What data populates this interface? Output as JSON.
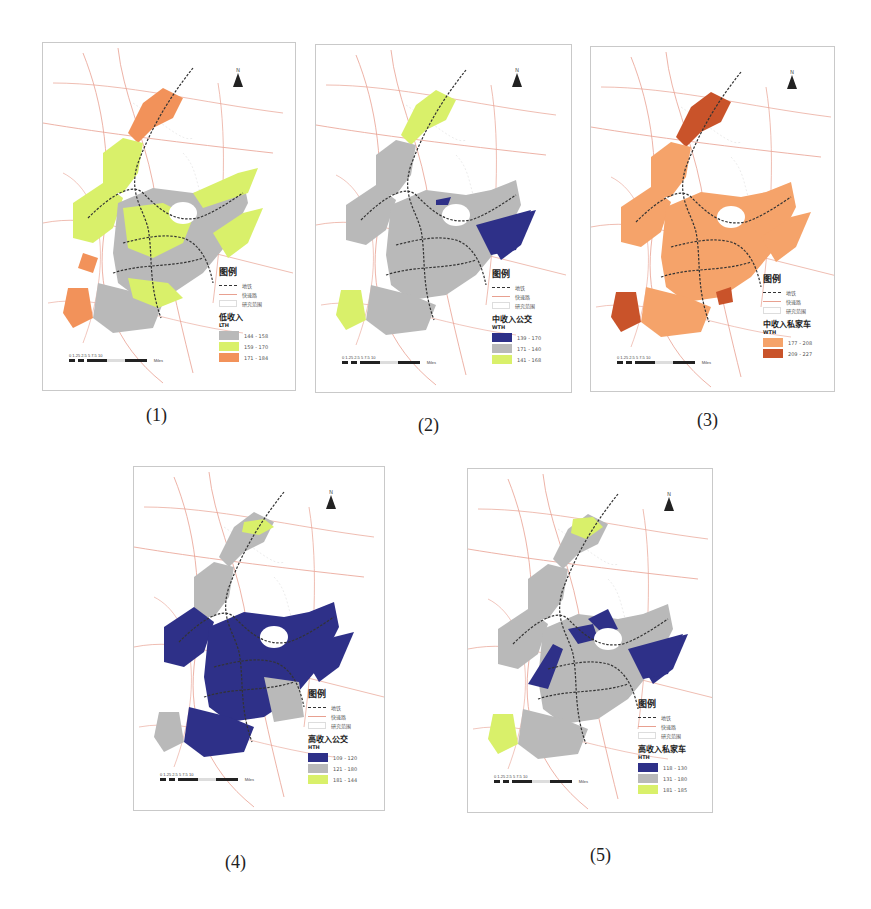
{
  "figure": {
    "panels": [
      {
        "id": "1",
        "label": "(1)",
        "north": "N",
        "legend": {
          "title": "图例",
          "metro": "地铁",
          "expressway": "快速路",
          "study_area": "研究范围",
          "class_title": "低收入",
          "unit": "LTH",
          "classes": [
            {
              "range": "144 - 158",
              "color": "#b9b9b9"
            },
            {
              "range": "159 - 170",
              "color": "#d9f06a"
            },
            {
              "range": "171 - 184",
              "color": "#f2925a"
            }
          ]
        },
        "scale": {
          "ticks": "0 1.25 2.5    5      7.5     10",
          "unit": "Miles"
        }
      },
      {
        "id": "2",
        "label": "(2)",
        "north": "N",
        "legend": {
          "title": "图例",
          "metro": "地铁",
          "expressway": "快速路",
          "study_area": "研究范围",
          "class_title": "中收入公交",
          "unit": "WTH",
          "classes": [
            {
              "range": "139 - 170",
              "color": "#2e3088"
            },
            {
              "range": "171 - 140",
              "color": "#b9b9b9"
            },
            {
              "range": "141 - 168",
              "color": "#d9f06a"
            }
          ]
        },
        "scale": {
          "ticks": "0 1.25 2.5    5      7.5     10",
          "unit": "Miles"
        }
      },
      {
        "id": "3",
        "label": "(3)",
        "north": "N",
        "legend": {
          "title": "图例",
          "metro": "地铁",
          "expressway": "快速路",
          "study_area": "研究范围",
          "class_title": "中收入私家车",
          "unit": "WTH",
          "classes": [
            {
              "range": "177 - 208",
              "color": "#f5a36a"
            },
            {
              "range": "209 - 227",
              "color": "#c9532a"
            }
          ]
        },
        "scale": {
          "ticks": "0 1.25 2.5    5      7.5     10",
          "unit": "Miles"
        }
      },
      {
        "id": "4",
        "label": "(4)",
        "north": "N",
        "legend": {
          "title": "图例",
          "metro": "地铁",
          "expressway": "快速路",
          "study_area": "研究范围",
          "class_title": "高收入公交",
          "unit": "HTH",
          "classes": [
            {
              "range": "109 - 120",
              "color": "#2e3088"
            },
            {
              "range": "121 - 180",
              "color": "#b9b9b9"
            },
            {
              "range": "181 - 144",
              "color": "#d9f06a"
            }
          ]
        },
        "scale": {
          "ticks": "0 1.25 2.5    5      7.5     10",
          "unit": "Miles"
        }
      },
      {
        "id": "5",
        "label": "(5)",
        "north": "N",
        "legend": {
          "title": "图例",
          "metro": "地铁",
          "expressway": "快速路",
          "study_area": "研究范围",
          "class_title": "高收入私家车",
          "unit": "HTH",
          "classes": [
            {
              "range": "118 - 130",
              "color": "#2e3088"
            },
            {
              "range": "131 - 180",
              "color": "#b9b9b9"
            },
            {
              "range": "181 - 185",
              "color": "#d9f06a"
            }
          ]
        },
        "scale": {
          "ticks": "0 1.25 2.5    5      7.5     10",
          "unit": "Miles"
        }
      }
    ]
  },
  "colors": {
    "road": "#e8a090",
    "road_minor": "#d8d8d8",
    "metro": "#333333",
    "panel_border": "#c9c9c9"
  }
}
